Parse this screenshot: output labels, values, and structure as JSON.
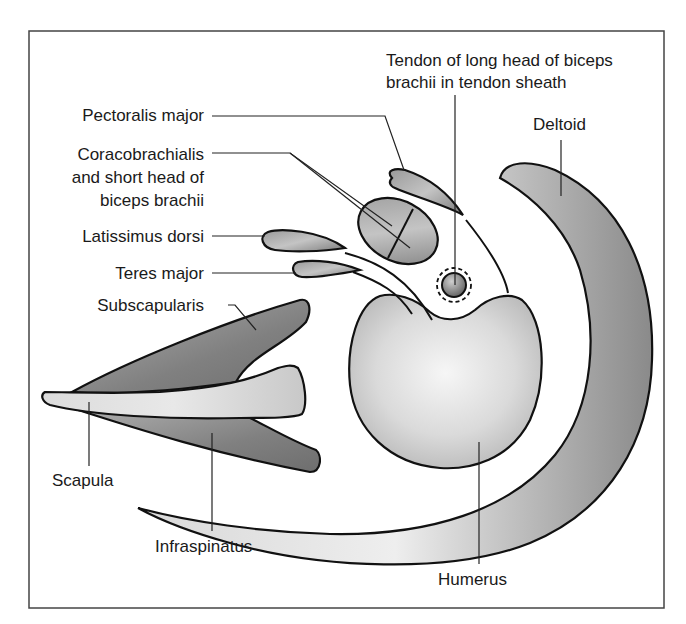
{
  "diagram": {
    "labels": {
      "tendon_line1": "Tendon of long head of biceps",
      "tendon_line2": "brachii in tendon sheath",
      "deltoid": "Deltoid",
      "pectoralis_major": "Pectoralis major",
      "coracobrachialis_line1": "Coracobrachialis",
      "coracobrachialis_line2": "and short head of",
      "coracobrachialis_line3": "biceps brachii",
      "latissimus_dorsi": "Latissimus dorsi",
      "teres_major": "Teres major",
      "subscapularis": "Subscapularis",
      "scapula": "Scapula",
      "infraspinatus": "Infraspinatus",
      "humerus": "Humerus"
    },
    "colors": {
      "frame": "#444444",
      "outline": "#111111",
      "muscle_dark": "#7a7a7a",
      "muscle_mid": "#a8a8a8",
      "bone_light": "#e8e8e8",
      "text": "#1a1a1a"
    }
  }
}
